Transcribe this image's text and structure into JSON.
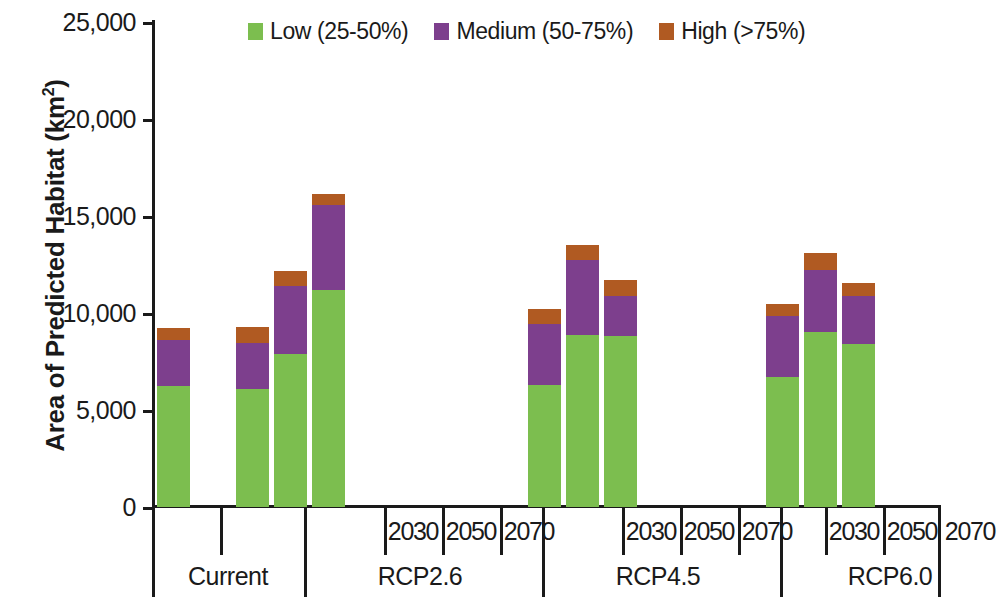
{
  "chart_data": {
    "type": "bar",
    "subtype": "stacked-bar-grouped",
    "title": "",
    "xlabel": "",
    "ylabel": "Area of Predicted Habitat (km2)",
    "ylabel_display": "Area of Predicted Habitat (km",
    "ylabel_super": "2",
    "ylabel_tail": ")",
    "ylim": [
      0,
      25000
    ],
    "ytick_values": [
      0,
      5000,
      10000,
      15000,
      20000,
      25000
    ],
    "ytick_labels": [
      "0",
      "5,000",
      "10,000",
      "15,000",
      "20,000",
      "25,000"
    ],
    "grid": false,
    "legend_position": "top-center",
    "series": [
      {
        "name": "Low (25-50%)",
        "color": "#7cbe4f",
        "values": [
          6240,
          6080,
          7900,
          11190,
          6300,
          8850,
          8830,
          6700,
          9000,
          8400
        ]
      },
      {
        "name": "Medium (50-75%)",
        "color": "#7d3f8d",
        "values": [
          2370,
          2400,
          3500,
          4380,
          3150,
          3900,
          2050,
          3150,
          3200,
          2500
        ]
      },
      {
        "name": "High (>75%)",
        "color": "#b05a22",
        "values": [
          620,
          800,
          780,
          560,
          750,
          750,
          830,
          620,
          900,
          670
        ]
      }
    ],
    "categories": [
      "Current",
      "RCP2.6 2030",
      "RCP2.6 2050",
      "RCP2.6 2070",
      "RCP4.5 2030",
      "RCP4.5 2050",
      "RCP4.5 2070",
      "RCP6.0 2030",
      "RCP6.0 2050",
      "RCP6.0 2070"
    ],
    "totals": [
      9230,
      9280,
      12180,
      16130,
      10200,
      13500,
      11710,
      10470,
      13100,
      11570
    ]
  },
  "legend": {
    "items": [
      {
        "label": "Low (25-50%)",
        "color": "#7cbe4f",
        "swatch": "legend-swatch-low"
      },
      {
        "label": "Medium (50-75%)",
        "color": "#7d3f8d",
        "swatch": "legend-swatch-medium"
      },
      {
        "label": "High (>75%)",
        "color": "#b05a22",
        "swatch": "legend-swatch-high"
      }
    ]
  },
  "yaxis": {
    "title_main": "Area of Predicted Habitat (km",
    "title_super": "2",
    "title_tail": ")",
    "ticks": [
      {
        "label": "25,000",
        "value": 25000
      },
      {
        "label": "20,000",
        "value": 20000
      },
      {
        "label": "15,000",
        "value": 15000
      },
      {
        "label": "10,000",
        "value": 10000
      },
      {
        "label": "5,000",
        "value": 5000
      },
      {
        "label": "0",
        "value": 0
      }
    ]
  },
  "xaxis": {
    "groups": [
      {
        "scenario": "Current",
        "years": [
          ""
        ]
      },
      {
        "scenario": "RCP2.6",
        "years": [
          "2030",
          "2050",
          "2070"
        ]
      },
      {
        "scenario": "RCP4.5",
        "years": [
          "2030",
          "2050",
          "2070"
        ]
      },
      {
        "scenario": "RCP6.0",
        "years": [
          "2030",
          "2050",
          "2070"
        ]
      }
    ]
  }
}
